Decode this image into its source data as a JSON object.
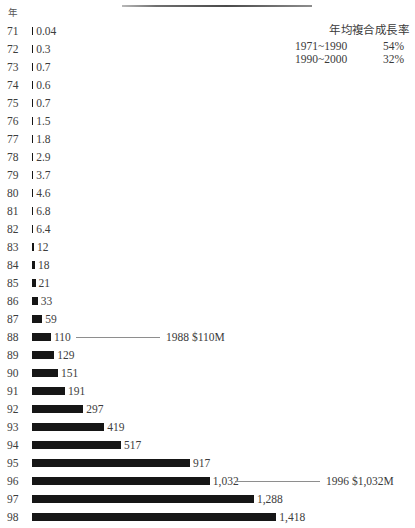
{
  "axis_caption": "年",
  "legend": {
    "title": "年均複合成長率",
    "rows": [
      {
        "period": "1971~1990",
        "value": "54%"
      },
      {
        "period": "1990~2000",
        "value": "32%"
      }
    ]
  },
  "callouts": [
    {
      "year": "88",
      "text": "1988 $110M"
    },
    {
      "year": "96",
      "text": "1996 $1,032M"
    }
  ],
  "chart_data": {
    "type": "bar",
    "orientation": "horizontal",
    "title": "",
    "subtitle": "",
    "xlabel": "",
    "ylabel": "年",
    "grid": false,
    "legend_position": "top-right",
    "xlim": [
      0,
      1418
    ],
    "categories": [
      "71",
      "72",
      "73",
      "74",
      "75",
      "76",
      "77",
      "78",
      "79",
      "80",
      "81",
      "82",
      "83",
      "84",
      "85",
      "86",
      "87",
      "88",
      "89",
      "90",
      "91",
      "92",
      "93",
      "94",
      "95",
      "96",
      "97",
      "98"
    ],
    "values": [
      0.04,
      0.3,
      0.7,
      0.6,
      0.7,
      1.5,
      1.8,
      2.9,
      3.7,
      4.6,
      6.8,
      6.4,
      12,
      18,
      21,
      33,
      59,
      110,
      129,
      151,
      191,
      297,
      419,
      517,
      917,
      1032,
      1288,
      1418
    ],
    "value_labels": [
      "0.04",
      "0.3",
      "0.7",
      "0.6",
      "0.7",
      "1.5",
      "1.8",
      "2.9",
      "3.7",
      "4.6",
      "6.8",
      "6.4",
      "12",
      "18",
      "21",
      "33",
      "59",
      "110",
      "129",
      "151",
      "191",
      "297",
      "419",
      "517",
      "917",
      "1,032",
      "1,288",
      "1,418"
    ],
    "annotations": [
      {
        "category": "88",
        "text": "1988 $110M"
      },
      {
        "category": "96",
        "text": "1996 $1,032M"
      }
    ],
    "bar_color": "#161616"
  }
}
